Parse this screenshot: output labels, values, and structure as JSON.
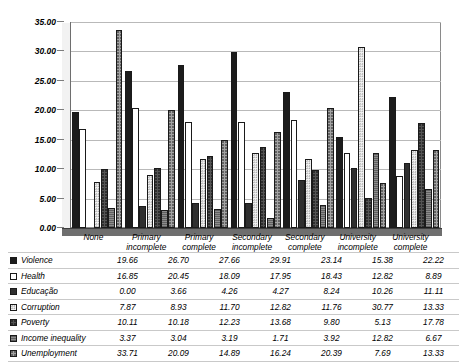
{
  "chart_data": {
    "type": "bar",
    "title": "",
    "subtitle": "",
    "xlabel": "",
    "ylabel": "",
    "ylim": [
      0,
      35
    ],
    "ytick_step": 5,
    "ytick_labels": [
      "35.00",
      "30.00",
      "25.00",
      "20.00",
      "15.00",
      "10.00",
      "5.00",
      "0.00"
    ],
    "grid": true,
    "legend_position": "table-left",
    "categories": [
      "None",
      "Primary incomplete",
      "Primary complete",
      "Secondary incomplete",
      "Secondary complete",
      "University incomplete",
      "University complete"
    ],
    "category_lines": [
      [
        "None"
      ],
      [
        "Primary",
        "incomplete"
      ],
      [
        "Primary",
        "complete"
      ],
      [
        "Secondary",
        "incomplete"
      ],
      [
        "Secondary",
        "complete"
      ],
      [
        "University",
        "incomplete"
      ],
      [
        "University",
        "complete"
      ]
    ],
    "series": [
      {
        "name": "Violence",
        "swatch": "solid-black",
        "values": [
          19.66,
          26.7,
          27.66,
          29.91,
          23.14,
          15.38,
          22.22
        ]
      },
      {
        "name": "Health",
        "swatch": "white-outline",
        "values": [
          16.85,
          20.45,
          18.09,
          17.95,
          18.43,
          12.82,
          8.89
        ]
      },
      {
        "name": "Educação",
        "swatch": "dark-dotted",
        "values": [
          0.0,
          3.66,
          4.26,
          4.27,
          8.24,
          10.26,
          11.11
        ]
      },
      {
        "name": "Corruption",
        "swatch": "light-dotted",
        "values": [
          7.87,
          8.93,
          11.7,
          12.82,
          11.76,
          30.77,
          13.33
        ]
      },
      {
        "name": "Poverty",
        "swatch": "mid-dark",
        "values": [
          10.11,
          10.18,
          12.23,
          13.68,
          9.8,
          5.13,
          17.78
        ]
      },
      {
        "name": "Income inequality",
        "swatch": "hatched-grey",
        "values": [
          3.37,
          3.04,
          3.19,
          1.71,
          3.92,
          12.82,
          6.67
        ]
      },
      {
        "name": "Unemployment",
        "swatch": "light-grey-dotted",
        "values": [
          33.71,
          20.09,
          14.89,
          16.24,
          20.39,
          7.69,
          13.33
        ]
      }
    ]
  }
}
